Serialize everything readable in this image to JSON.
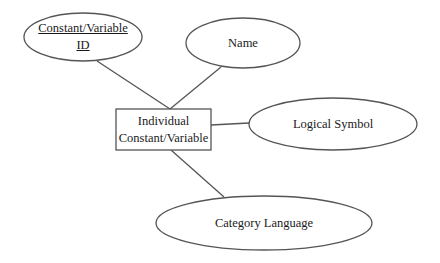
{
  "diagram": {
    "type": "er-diagram",
    "entity": {
      "id": "individual-constant-variable",
      "label_lines": [
        "Individual",
        "Constant/Variable"
      ],
      "box": {
        "x": 116,
        "y": 109,
        "w": 95,
        "h": 41
      }
    },
    "attributes": [
      {
        "id": "constant-variable-id",
        "label_lines": [
          "Constant/Variable",
          "ID"
        ],
        "key": true,
        "ellipse": {
          "cx": 83,
          "cy": 37,
          "rx": 59,
          "ry": 24
        }
      },
      {
        "id": "name",
        "label_lines": [
          "Name"
        ],
        "key": false,
        "ellipse": {
          "cx": 243,
          "cy": 43,
          "rx": 57,
          "ry": 25
        }
      },
      {
        "id": "logical-symbol",
        "label_lines": [
          "Logical Symbol"
        ],
        "key": false,
        "ellipse": {
          "cx": 333,
          "cy": 124,
          "rx": 84,
          "ry": 26
        }
      },
      {
        "id": "category-language",
        "label_lines": [
          "Category Language"
        ],
        "key": false,
        "ellipse": {
          "cx": 264,
          "cy": 223,
          "rx": 108,
          "ry": 27
        }
      }
    ],
    "connections": [
      {
        "from": "constant-variable-id",
        "to": "individual-constant-variable",
        "x1": 97,
        "y1": 61,
        "x2": 170,
        "y2": 109
      },
      {
        "from": "name",
        "to": "individual-constant-variable",
        "x1": 221,
        "y1": 67,
        "x2": 170,
        "y2": 109
      },
      {
        "from": "logical-symbol",
        "to": "individual-constant-variable",
        "x1": 249,
        "y1": 123,
        "x2": 211,
        "y2": 125
      },
      {
        "from": "category-language",
        "to": "individual-constant-variable",
        "x1": 224,
        "y1": 197,
        "x2": 171,
        "y2": 150
      }
    ],
    "stroke_color": "#555555",
    "fill_color": "#ffffff"
  }
}
